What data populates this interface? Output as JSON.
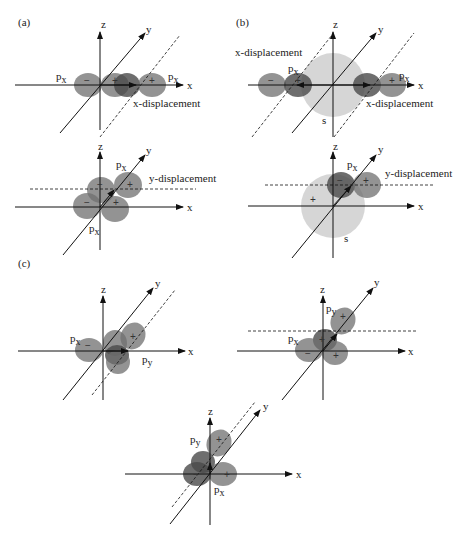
{
  "figure": {
    "panels": [
      {
        "id": "a",
        "label": "(a)"
      },
      {
        "id": "b",
        "label": "(b)"
      },
      {
        "id": "c",
        "label": "(c)"
      }
    ],
    "axes": {
      "x": "x",
      "y": "y",
      "z": "z"
    },
    "orbitals": {
      "px": "p",
      "px_sub": "x",
      "py": "p",
      "py_sub": "y",
      "s": "s"
    },
    "signs": {
      "plus": "+",
      "minus": "−"
    },
    "annotations": {
      "x_displacement": "x-displacement",
      "y_displacement": "y-displacement"
    },
    "colors": {
      "p_lobe": "#6f6f6f",
      "p_lobe_overlap": "#4a4a4a",
      "s_orbital": "#cfcfcf",
      "axis": "#111111",
      "background": "#ffffff"
    }
  }
}
